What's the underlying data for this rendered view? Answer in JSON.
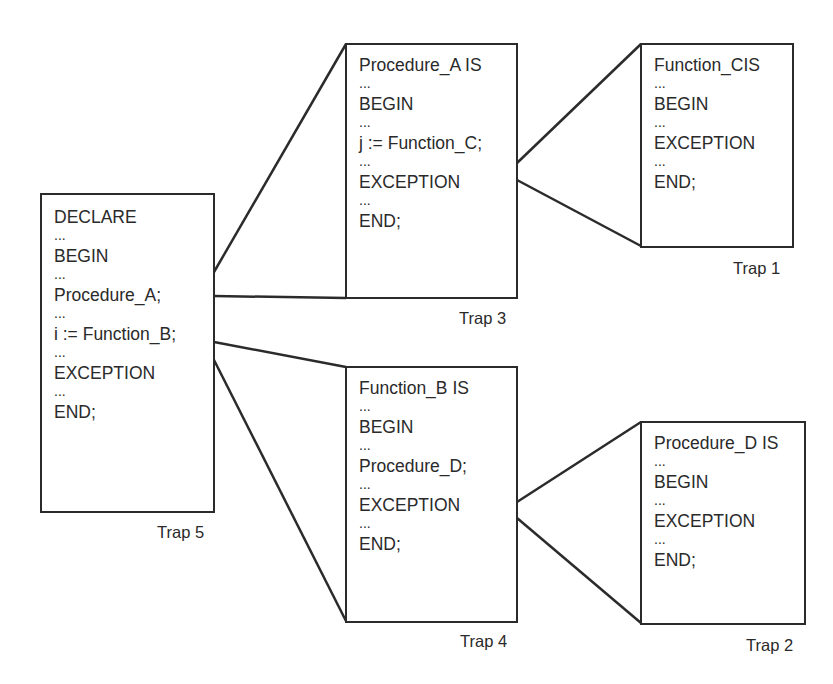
{
  "diagram": {
    "type": "exception-handler-trap-nesting",
    "blocks": [
      {
        "id": "trap5",
        "label": "Trap 5",
        "lines": [
          "DECLARE",
          "...",
          "BEGIN",
          "...",
          "Procedure_A;",
          "...",
          "i := Function_B;",
          "...",
          "EXCEPTION",
          "...",
          "END;"
        ]
      },
      {
        "id": "trap3",
        "label": "Trap 3",
        "lines": [
          "Procedure_A IS",
          "...",
          "BEGIN",
          "...",
          "j := Function_C;",
          "...",
          "EXCEPTION",
          "...",
          "END;"
        ]
      },
      {
        "id": "trap1",
        "label": "Trap 1",
        "lines": [
          "Function_CIS",
          "...",
          "BEGIN",
          "...",
          "EXCEPTION",
          "...",
          "END;"
        ]
      },
      {
        "id": "trap4",
        "label": "Trap 4",
        "lines": [
          "Function_B IS",
          "...",
          "BEGIN",
          "...",
          "Procedure_D;",
          "...",
          "EXCEPTION",
          "...",
          "END;"
        ]
      },
      {
        "id": "trap2",
        "label": "Trap 2",
        "lines": [
          "Procedure_D IS",
          "...",
          "BEGIN",
          "...",
          "EXCEPTION",
          "...",
          "END;"
        ]
      }
    ],
    "edges": [
      {
        "from": "trap5",
        "via": "Procedure_A;",
        "to": "trap3"
      },
      {
        "from": "trap5",
        "via": "i := Function_B;",
        "to": "trap4"
      },
      {
        "from": "trap3",
        "via": "j := Function_C;",
        "to": "trap1"
      },
      {
        "from": "trap4",
        "via": "Procedure_D;",
        "to": "trap2"
      }
    ],
    "colors": {
      "line": "#2b2b2b",
      "text": "#2a2a2a",
      "background": "#ffffff"
    }
  }
}
